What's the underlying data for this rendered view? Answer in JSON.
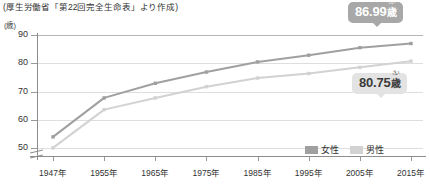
{
  "source_note": "(厚生労働省「第22回完全生命表」より作成)",
  "y_axis": {
    "unit_label": "(歳)",
    "ticks": [
      "90",
      "80",
      "70",
      "60",
      "50"
    ]
  },
  "x_axis": {
    "ticks": [
      "1947年",
      "1955年",
      "1965年",
      "1975年",
      "1985年",
      "1995年",
      "2005年",
      "2015年"
    ]
  },
  "legend": {
    "entries": [
      {
        "label": "女性",
        "color": "#a0a0a0"
      },
      {
        "label": "男性",
        "color": "#d2d2d2"
      }
    ]
  },
  "callouts": {
    "female": {
      "value": "86.99",
      "unit": "歳",
      "ruby": "さい"
    },
    "male": {
      "value": "80.75",
      "unit": "歳",
      "ruby": "さい"
    }
  },
  "chart_data": {
    "type": "line",
    "title": "",
    "subtitle": "",
    "xlabel": "",
    "ylabel": "(歳)",
    "categories": [
      "1947年",
      "1955年",
      "1965年",
      "1975年",
      "1985年",
      "1995年",
      "2005年",
      "2015年"
    ],
    "x": [
      1947,
      1955,
      1965,
      1975,
      1985,
      1995,
      2005,
      2015
    ],
    "series": [
      {
        "name": "女性",
        "color": "#a0a0a0",
        "values": [
          53.96,
          67.75,
          72.92,
          76.89,
          80.48,
          82.85,
          85.52,
          86.99
        ],
        "end_label": "86.99歳"
      },
      {
        "name": "男性",
        "color": "#d2d2d2",
        "values": [
          50.06,
          63.6,
          67.74,
          71.73,
          74.78,
          76.38,
          78.56,
          80.75
        ],
        "end_label": "80.75歳"
      }
    ],
    "ylim": [
      47,
      90
    ],
    "yticks": [
      50,
      60,
      70,
      80,
      90
    ],
    "grid": true,
    "legend_position": "bottom-right",
    "annotations": [
      {
        "text": "86.99歳",
        "series": "女性",
        "at_x": 2015
      },
      {
        "text": "80.75歳",
        "series": "男性",
        "at_x": 2015
      }
    ],
    "note": "(厚生労働省「第22回完全生命表」より作成)"
  }
}
